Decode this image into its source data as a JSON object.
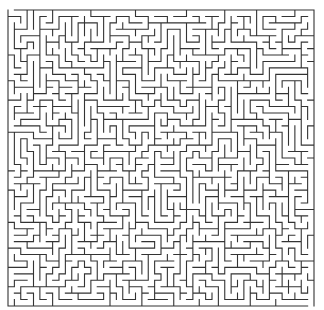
{
  "maze": {
    "type": "rectangular-grid-maze",
    "origin": {
      "x": 8,
      "y": 10
    },
    "size": {
      "width": 306,
      "height": 296
    },
    "columns": 48,
    "rows": 46,
    "wall_color": "#333333",
    "background_color": "#ffffff",
    "wall_width": 1.1,
    "entrance": {
      "side": "top",
      "column": 0
    },
    "exit": {
      "side": "bottom",
      "column": 47
    },
    "seed": 1337
  }
}
